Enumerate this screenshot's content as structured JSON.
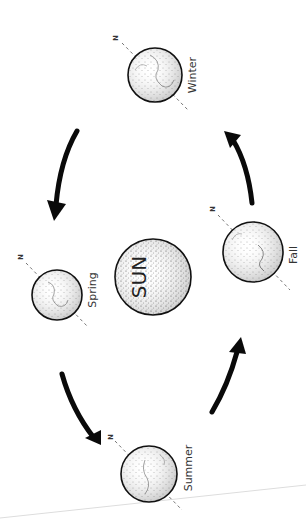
{
  "diagram": {
    "type": "seasons-orbit",
    "center_body": {
      "label": "SUN",
      "cx": 153,
      "cy": 277,
      "r": 38
    },
    "north_label": "N",
    "earths": [
      {
        "season": "Winter",
        "cx": 155,
        "cy": 75,
        "r": 27,
        "n_x": 117,
        "n_y": 38,
        "label_x": 193,
        "label_y": 75
      },
      {
        "season": "Spring",
        "cx": 57,
        "cy": 295,
        "r": 25,
        "n_x": 22,
        "n_y": 258,
        "label_x": 93,
        "label_y": 290
      },
      {
        "season": "Fall",
        "cx": 253,
        "cy": 252,
        "r": 30,
        "n_x": 213,
        "n_y": 210,
        "label_x": 293,
        "label_y": 255
      },
      {
        "season": "Summer",
        "cx": 149,
        "cy": 474,
        "r": 28,
        "n_x": 111,
        "n_y": 437,
        "label_x": 188,
        "label_y": 468
      }
    ],
    "arrows": [
      {
        "from": "Winter",
        "to": "Spring",
        "direction": "counterclockwise"
      },
      {
        "from": "Spring",
        "to": "Summer",
        "direction": "counterclockwise"
      },
      {
        "from": "Summer",
        "to": "Fall",
        "direction": "counterclockwise"
      },
      {
        "from": "Fall",
        "to": "Winter",
        "direction": "counterclockwise"
      }
    ],
    "colors": {
      "outline": "#111111",
      "arrow": "#0a0a0a",
      "stipple": "#555555",
      "axis": "#666666",
      "page_edge": "#dddddd"
    }
  }
}
